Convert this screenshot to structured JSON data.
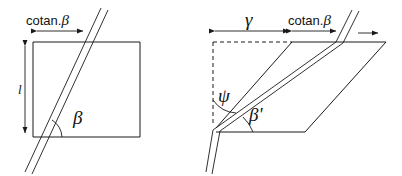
{
  "figure": {
    "background_color": "#ffffff",
    "line_color": "#1a1a1a",
    "width": 402,
    "height": 176
  },
  "left_diagram": {
    "name": "square-with-inclined-band",
    "dimension_top": {
      "label": "cotan.",
      "symbol": "β",
      "full": "cotan.β",
      "arrow_style": "double-headed"
    },
    "dimension_left": {
      "label": "l",
      "arrow_style": "double-headed",
      "orientation": "vertical"
    },
    "angle": {
      "label": "β",
      "marker": "arc",
      "position": "bottom-left-interior"
    },
    "shape": "square",
    "band": "double-parallel-line"
  },
  "right_diagram": {
    "name": "sheared-parallelogram",
    "dimension_gamma": {
      "label": "γ",
      "arrow_style": "double-headed"
    },
    "dimension_cotan": {
      "label": "cotan.",
      "symbol": "β",
      "full": "cotan.β",
      "arrow_style": "double-headed"
    },
    "angle_psi": {
      "label": "ψ",
      "marker": "arc",
      "position": "left-vertical-interior"
    },
    "angle_beta_prime": {
      "label": "β'",
      "marker": "arc",
      "position": "bottom-left-interior"
    },
    "shear_arrow": {
      "label": "",
      "direction": "right",
      "name": "shear-direction-arrow"
    },
    "reference_lines": "dashed",
    "shape": "parallelogram",
    "band": "double-parallel-line"
  }
}
